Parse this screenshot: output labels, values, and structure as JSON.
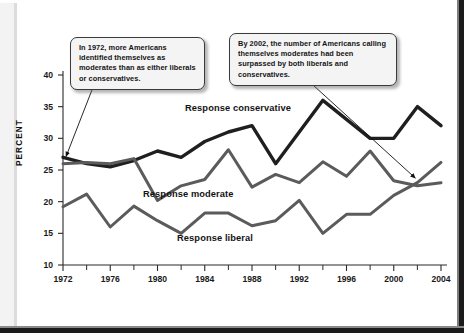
{
  "chart_data": {
    "type": "line",
    "title": "",
    "xlabel": "",
    "ylabel": "PERCENT",
    "xlim": [
      1972,
      2004
    ],
    "ylim": [
      10,
      40
    ],
    "grid": false,
    "legend_position": "inline-labels",
    "y_ticks": [
      10,
      15,
      20,
      25,
      30,
      35,
      40
    ],
    "x_ticks_major": [
      1972,
      1976,
      1980,
      1984,
      1988,
      1992,
      1996,
      2000,
      2004
    ],
    "x_ticks_minor": [
      1974,
      1978,
      1982,
      1986,
      1990,
      1994,
      1998,
      2002
    ],
    "x": [
      1972,
      1974,
      1976,
      1978,
      1980,
      1982,
      1984,
      1986,
      1988,
      1990,
      1992,
      1994,
      1996,
      1998,
      2000,
      2002,
      2004
    ],
    "series": [
      {
        "name": "Response conservative",
        "color": "#1f1f1f",
        "values": [
          27,
          26,
          25.5,
          26.5,
          28,
          27,
          29.5,
          31,
          32,
          26,
          31,
          36,
          33,
          30,
          30,
          35,
          32
        ]
      },
      {
        "name": "Response moderate",
        "color": "#5b5b5b",
        "values": [
          26,
          26.2,
          26,
          26.8,
          20.2,
          22.5,
          23.5,
          28.2,
          22.3,
          24.3,
          23,
          26.3,
          24,
          28,
          23.3,
          22.5,
          23
        ]
      },
      {
        "name": "Response liberal",
        "color": "#5b5b5b",
        "values": [
          19.2,
          21.2,
          16,
          19.3,
          17,
          15,
          18.2,
          18.2,
          16.2,
          17,
          20.2,
          15,
          18,
          18,
          21,
          23,
          26.2
        ]
      }
    ],
    "annotations": [
      {
        "id": "callout-1",
        "text": "In 1972, more Americans identified themselves as moderates than as either liberals or conservatives.",
        "points_to_year": 1972,
        "points_to_value": 26.5
      },
      {
        "id": "callout-2",
        "text": "By 2002, the number of Americans calling themselves moderates had been surpassed by both liberals and conservatives.",
        "points_to_year": 2002,
        "points_to_value": 23.0
      }
    ]
  },
  "axis": {
    "y_title": "PERCENT",
    "y_labels": [
      "40",
      "35",
      "30",
      "25",
      "20",
      "15",
      "10"
    ],
    "x_labels": [
      "1972",
      "1976",
      "1980",
      "1984",
      "1988",
      "1992",
      "1996",
      "2000",
      "2004"
    ]
  },
  "series_labels": {
    "conservative": "Response conservative",
    "moderate": "Response moderate",
    "liberal": "Response liberal"
  },
  "callouts": {
    "first": "In 1972, more Americans identified themselves as moderates than as either liberals or conservatives.",
    "second": "By 2002, the number of Americans calling themselves moderates had been surpassed by both liberals and conservatives."
  },
  "colors": {
    "conservative_line": "#1f1f1f",
    "moderate_line": "#5b5b5b",
    "liberal_line": "#5b5b5b",
    "axis": "#2a2a2a",
    "callout_fill": "#f4f4f4",
    "callout_border": "#3a3a3a",
    "page_background": "#ffffff",
    "frame": "#1b1b1b"
  }
}
